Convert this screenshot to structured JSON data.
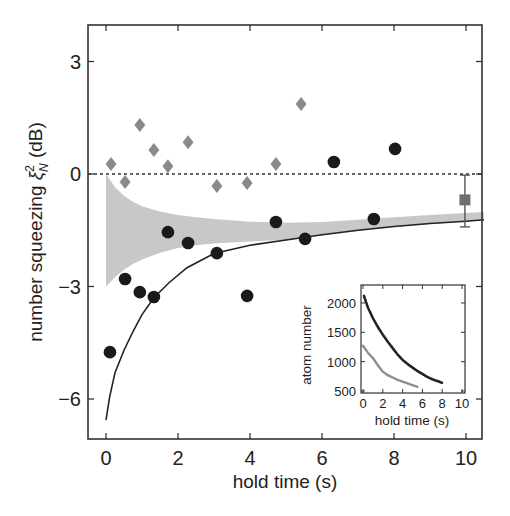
{
  "chart_data": {
    "type": "scatter",
    "title": "",
    "xlabel": "hold time (s)",
    "ylabel": "number squeezing ξ²_N (dB)",
    "ylabel_parts": {
      "main": "number squeezing ",
      "symbol": "ξ",
      "sup": "2",
      "sub": "N",
      "unit": " (dB)"
    },
    "xlim": [
      -0.5,
      10.5
    ],
    "ylim": [
      -7.07,
      3.97
    ],
    "xticks": [
      0,
      2,
      4,
      6,
      8,
      10
    ],
    "xtick_labels": [
      "0",
      "2",
      "4",
      "6",
      "8",
      "10"
    ],
    "yticks": [
      -6,
      -3,
      0,
      3
    ],
    "ytick_labels": [
      "−6",
      "−3",
      "0",
      "3"
    ],
    "grid": false,
    "reference_line": {
      "y": 0,
      "style": "dotted"
    },
    "series": [
      {
        "name": "diamonds (gray)",
        "marker": "diamond",
        "color": "#8a8a8a",
        "x": [
          0.14,
          0.53,
          0.94,
          1.33,
          1.72,
          2.28,
          3.08,
          3.92,
          4.72,
          5.42
        ],
        "y": [
          0.27,
          -0.21,
          1.31,
          0.64,
          0.21,
          0.85,
          -0.32,
          -0.24,
          0.27,
          1.87
        ]
      },
      {
        "name": "circles (black)",
        "marker": "circle",
        "color": "#1a1a1a",
        "x": [
          0.11,
          0.53,
          0.94,
          1.33,
          1.72,
          2.28,
          3.08,
          3.92,
          4.72,
          5.53,
          6.33,
          7.44,
          8.03
        ],
        "y": [
          -4.75,
          -2.8,
          -3.15,
          -3.28,
          -1.55,
          -1.84,
          -2.11,
          -3.25,
          -1.28,
          -1.73,
          0.32,
          -1.2,
          0.67
        ]
      },
      {
        "name": "square with error bar",
        "marker": "square",
        "color": "#6e6e6e",
        "x": [
          9.97
        ],
        "y": [
          -0.69
        ],
        "yerr_low": [
          -1.41
        ],
        "yerr_high": [
          -0.03
        ]
      },
      {
        "name": "theory curve",
        "type": "line",
        "color": "#222222",
        "x": [
          0.0,
          0.1,
          0.25,
          0.5,
          0.75,
          1.0,
          1.33,
          1.75,
          2.25,
          3.0,
          4.0,
          5.0,
          6.0,
          7.0,
          8.0,
          9.0,
          10.0,
          10.5
        ],
        "y": [
          -6.56,
          -5.95,
          -5.3,
          -4.7,
          -4.2,
          -3.75,
          -3.3,
          -2.9,
          -2.5,
          -2.12,
          -1.9,
          -1.76,
          -1.62,
          -1.5,
          -1.4,
          -1.32,
          -1.26,
          -1.22
        ]
      },
      {
        "name": "gray band",
        "type": "area",
        "color": "#c8c8c8",
        "x": [
          0.0,
          0.25,
          0.5,
          0.75,
          1.0,
          1.5,
          2.0,
          2.5,
          3.0,
          4.0,
          5.0,
          6.0,
          7.0,
          8.0,
          9.0,
          10.0,
          10.5
        ],
        "upper": [
          0.0,
          -0.35,
          -0.58,
          -0.74,
          -0.86,
          -1.0,
          -1.09,
          -1.15,
          -1.2,
          -1.27,
          -1.3,
          -1.28,
          -1.22,
          -1.15,
          -1.09,
          -1.04,
          -1.01
        ],
        "lower": [
          -3.0,
          -2.75,
          -2.55,
          -2.4,
          -2.28,
          -2.1,
          -1.97,
          -1.9,
          -1.85,
          -1.8,
          -1.76,
          -1.64,
          -1.52,
          -1.42,
          -1.33,
          -1.26,
          -1.23
        ]
      }
    ],
    "inset": {
      "type": "scatter",
      "xlabel": "hold time (s)",
      "ylabel": "atom number",
      "xlim": [
        -0.5,
        10.2
      ],
      "ylim": [
        500,
        2200
      ],
      "xticks": [
        0,
        2,
        4,
        6,
        8,
        10
      ],
      "xtick_labels": [
        "0",
        "2",
        "4",
        "6",
        "8",
        "10"
      ],
      "yticks": [
        500,
        1000,
        1500,
        2000
      ],
      "ytick_labels": [
        "500",
        "1000",
        "1500",
        "2000"
      ],
      "series": [
        {
          "name": "dark",
          "color": "#222222",
          "x": [
            0.1,
            0.5,
            1.0,
            1.5,
            2.0,
            2.5,
            3.0,
            3.5,
            4.0,
            4.5,
            5.0,
            5.5,
            6.0,
            6.5,
            7.0,
            7.5,
            8.0
          ],
          "y": [
            2120,
            1920,
            1740,
            1590,
            1460,
            1340,
            1230,
            1120,
            1030,
            960,
            900,
            840,
            790,
            740,
            700,
            670,
            640
          ]
        },
        {
          "name": "gray",
          "color": "#8f8f8f",
          "x": [
            0.0,
            0.5,
            1.0,
            1.5,
            2.0,
            2.5,
            3.0,
            3.5,
            4.0,
            4.5,
            5.0,
            5.5
          ],
          "y": [
            1270,
            1150,
            1060,
            940,
            830,
            770,
            730,
            690,
            660,
            630,
            600,
            570
          ]
        }
      ]
    }
  }
}
